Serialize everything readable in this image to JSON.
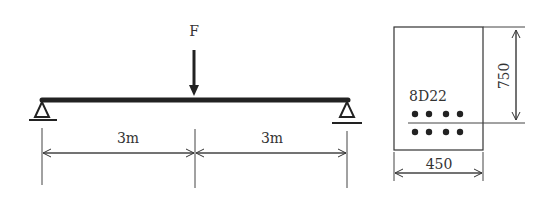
{
  "beam": {
    "load_label": "F",
    "span_left_label": "3m",
    "span_right_label": "3m"
  },
  "section": {
    "rebar_label": "8D22",
    "height_label": "750",
    "width_label": "450"
  },
  "colors": {
    "ink": "#222222",
    "text": "#333333"
  }
}
